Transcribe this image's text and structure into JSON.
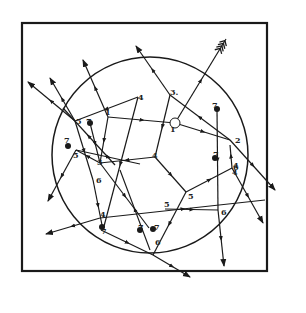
{
  "diagram": {
    "frame": {
      "x": 22,
      "y": 23,
      "w": 245,
      "h": 248
    },
    "circle": {
      "cx": 150,
      "cy": 155,
      "r": 98
    },
    "stroke_color": "#1a1a1a",
    "labels": [
      {
        "text": "1",
        "x": 170,
        "y": 132
      },
      {
        "text": "2",
        "x": 235,
        "y": 143
      },
      {
        "text": "3.",
        "x": 170,
        "y": 95
      },
      {
        "text": "4",
        "x": 138,
        "y": 100
      },
      {
        "text": "5",
        "x": 76,
        "y": 124
      },
      {
        "text": "1",
        "x": 105,
        "y": 115
      },
      {
        "text": "7",
        "x": 86,
        "y": 124
      },
      {
        "text": "7",
        "x": 64,
        "y": 143
      },
      {
        "text": "5",
        "x": 73,
        "y": 158
      },
      {
        "text": "3",
        "x": 97,
        "y": 165
      },
      {
        "text": "4",
        "x": 152,
        "y": 158
      },
      {
        "text": "6",
        "x": 96,
        "y": 183
      },
      {
        "text": "7",
        "x": 212,
        "y": 108
      },
      {
        "text": "6",
        "x": 233,
        "y": 170
      },
      {
        "text": "7",
        "x": 213,
        "y": 157
      },
      {
        "text": "4",
        "x": 233,
        "y": 168
      },
      {
        "text": "5",
        "x": 188,
        "y": 199
      },
      {
        "text": "6",
        "x": 221,
        "y": 215
      },
      {
        "text": "4",
        "x": 100,
        "y": 217
      },
      {
        "text": "7",
        "x": 101,
        "y": 234
      },
      {
        "text": "7",
        "x": 138,
        "y": 230
      },
      {
        "text": "7",
        "x": 154,
        "y": 230
      },
      {
        "text": "5",
        "x": 164,
        "y": 207
      },
      {
        "text": "6",
        "x": 155,
        "y": 245
      },
      {
        "text": "4",
        "x": 232,
        "y": 175
      }
    ],
    "dots": [
      {
        "x": 90,
        "y": 123
      },
      {
        "x": 68,
        "y": 146
      },
      {
        "x": 217,
        "y": 109
      },
      {
        "x": 215,
        "y": 158
      },
      {
        "x": 102,
        "y": 227
      },
      {
        "x": 140,
        "y": 230
      },
      {
        "x": 153,
        "y": 229
      }
    ],
    "open_node": {
      "x": 175,
      "y": 123,
      "r": 5
    },
    "segments": [
      {
        "x1": 175,
        "y1": 123,
        "x2": 226,
        "y2": 39,
        "head": "fletch"
      },
      {
        "x1": 108,
        "y1": 117,
        "x2": 175,
        "y2": 123
      },
      {
        "x1": 175,
        "y1": 123,
        "x2": 230,
        "y2": 140
      },
      {
        "x1": 230,
        "y1": 140,
        "x2": 170,
        "y2": 95
      },
      {
        "x1": 170,
        "y1": 95,
        "x2": 136,
        "y2": 46,
        "head": "arrow"
      },
      {
        "x1": 230,
        "y1": 140,
        "x2": 275,
        "y2": 190,
        "head": "arrow"
      },
      {
        "x1": 170,
        "y1": 95,
        "x2": 155,
        "y2": 157
      },
      {
        "x1": 138,
        "y1": 97,
        "x2": 75,
        "y2": 121
      },
      {
        "x1": 138,
        "y1": 97,
        "x2": 103,
        "y2": 230
      },
      {
        "x1": 108,
        "y1": 117,
        "x2": 83,
        "y2": 60,
        "head": "arrow"
      },
      {
        "x1": 108,
        "y1": 117,
        "x2": 100,
        "y2": 163
      },
      {
        "x1": 75,
        "y1": 121,
        "x2": 28,
        "y2": 82,
        "head": "arrow"
      },
      {
        "x1": 75,
        "y1": 121,
        "x2": 50,
        "y2": 78,
        "head": "arrow"
      },
      {
        "x1": 75,
        "y1": 121,
        "x2": 93,
        "y2": 180
      },
      {
        "x1": 90,
        "y1": 123,
        "x2": 100,
        "y2": 163
      },
      {
        "x1": 155,
        "y1": 157,
        "x2": 100,
        "y2": 163
      },
      {
        "x1": 100,
        "y1": 163,
        "x2": 76,
        "y2": 150
      },
      {
        "x1": 76,
        "y1": 150,
        "x2": 48,
        "y2": 201,
        "head": "arrow"
      },
      {
        "x1": 76,
        "y1": 150,
        "x2": 140,
        "y2": 164
      },
      {
        "x1": 100,
        "y1": 163,
        "x2": 149,
        "y2": 228
      },
      {
        "x1": 93,
        "y1": 180,
        "x2": 103,
        "y2": 230
      },
      {
        "x1": 155,
        "y1": 157,
        "x2": 186,
        "y2": 192
      },
      {
        "x1": 186,
        "y1": 192,
        "x2": 232,
        "y2": 168
      },
      {
        "x1": 232,
        "y1": 168,
        "x2": 263,
        "y2": 223,
        "head": "arrow"
      },
      {
        "x1": 232,
        "y1": 168,
        "x2": 230,
        "y2": 145
      },
      {
        "x1": 217,
        "y1": 109,
        "x2": 218,
        "y2": 210
      },
      {
        "x1": 165,
        "y1": 209,
        "x2": 218,
        "y2": 210
      },
      {
        "x1": 218,
        "y1": 210,
        "x2": 224,
        "y2": 266,
        "head": "arrow"
      },
      {
        "x1": 186,
        "y1": 192,
        "x2": 153,
        "y2": 255
      },
      {
        "x1": 153,
        "y1": 255,
        "x2": 190,
        "y2": 277,
        "head": "arrow"
      },
      {
        "x1": 100,
        "y1": 218,
        "x2": 265,
        "y2": 200
      },
      {
        "x1": 100,
        "y1": 218,
        "x2": 46,
        "y2": 234,
        "head": "arrow"
      },
      {
        "x1": 101,
        "y1": 230,
        "x2": 153,
        "y2": 255
      },
      {
        "x1": 150,
        "y1": 250,
        "x2": 120,
        "y2": 170
      },
      {
        "x1": 115,
        "y1": 165,
        "x2": 63,
        "y2": 108
      }
    ]
  }
}
